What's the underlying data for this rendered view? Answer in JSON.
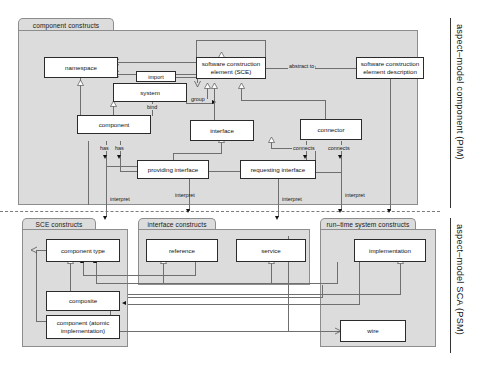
{
  "diagram": {
    "title_labels": {
      "pim": "aspect–model component (PIM)",
      "psm": "aspect–model SCA (PSM)"
    },
    "packages": [
      {
        "id": "component-constructs",
        "label": "component constructs"
      },
      {
        "id": "sce-constructs",
        "label": "SCE constructs"
      },
      {
        "id": "interface-constructs",
        "label": "interface constructs"
      },
      {
        "id": "runtime-system-constructs",
        "label": "run–time system constructs"
      }
    ],
    "nodes": {
      "namespace": "namespace",
      "system": "system",
      "component": "component",
      "sce": "software construction element (SCE)",
      "sce_description": "software construction element description",
      "interface": "interface",
      "connector": "connector",
      "providing_interface": "providing interface",
      "requesting_interface": "requesting interface",
      "component_type": "component type",
      "composite": "composite",
      "component_atomic": "component (atomic implementation)",
      "reference": "reference",
      "service": "service",
      "implementation": "implementation",
      "wire": "wire"
    },
    "edge_labels": {
      "import": "import",
      "bind": "bind",
      "group": "group",
      "abstract_to": "abstract to",
      "has_1": "has",
      "has_2": "has",
      "connects_1": "connects",
      "connects_2": "connects",
      "interpret_1": "interpret",
      "interpret_2": "interpret",
      "interpret_3": "interpret",
      "interpret_4": "interpret"
    },
    "colors": {
      "package_fill": "#dcdcdc",
      "box_fill": "#ffffff",
      "line": "#6f6f6f",
      "text": "#111111"
    }
  }
}
